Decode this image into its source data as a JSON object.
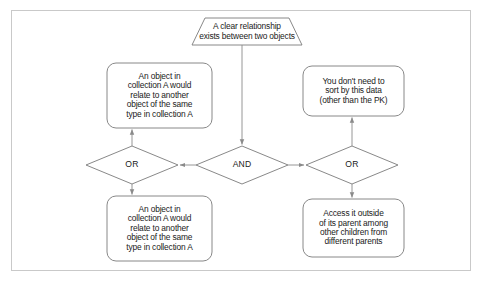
{
  "diagram": {
    "title_node": {
      "id": "condition-banner",
      "shape": "banner-pentagon",
      "text": "A clear relationship\nexists between two objects",
      "lines": [
        "A clear relationship",
        "exists between two objects"
      ]
    },
    "gates": [
      {
        "id": "gate-or-left",
        "label": "OR",
        "shape": "diamond"
      },
      {
        "id": "gate-and-center",
        "label": "AND",
        "shape": "diamond"
      },
      {
        "id": "gate-or-right",
        "label": "OR",
        "shape": "diamond"
      }
    ],
    "boxes": [
      {
        "id": "box-top-left",
        "lines": [
          "An object in",
          "collection A would",
          "relate to another",
          "object of the same",
          "type in collection A"
        ]
      },
      {
        "id": "box-top-right",
        "lines": [
          "You don't need to",
          "sort by this data",
          "(other than the PK)"
        ]
      },
      {
        "id": "box-bottom-left",
        "lines": [
          "An object in",
          "collection A would",
          "relate to another",
          "object of the same",
          "type in collection A"
        ]
      },
      {
        "id": "box-bottom-right",
        "lines": [
          "Access it outside",
          "of its parent among",
          "other children from",
          "different parents"
        ]
      }
    ],
    "connectors": [
      {
        "id": "banner-to-and",
        "from": "condition-banner",
        "to": "gate-and-center",
        "arrow": "down"
      },
      {
        "id": "and-to-or-left",
        "from": "gate-and-center",
        "to": "gate-or-left",
        "arrow": "left"
      },
      {
        "id": "and-to-or-right",
        "from": "gate-and-center",
        "to": "gate-or-right",
        "arrow": "right"
      },
      {
        "id": "or-left-to-box-top-left",
        "from": "gate-or-left",
        "to": "box-top-left",
        "arrow": "up"
      },
      {
        "id": "or-left-to-box-bottom-left",
        "from": "gate-or-left",
        "to": "box-bottom-left",
        "arrow": "down"
      },
      {
        "id": "or-right-to-box-top-right",
        "from": "gate-or-right",
        "to": "box-top-right",
        "arrow": "up"
      },
      {
        "id": "or-right-to-box-bottom-right",
        "from": "gate-or-right",
        "to": "box-bottom-right",
        "arrow": "down"
      }
    ],
    "colors": {
      "frame_border": "#c9c9c9",
      "shape_stroke": "#7a7a7a",
      "connector_stroke": "#8a8a8a",
      "text": "#1a1a1a",
      "background": "#ffffff"
    }
  }
}
